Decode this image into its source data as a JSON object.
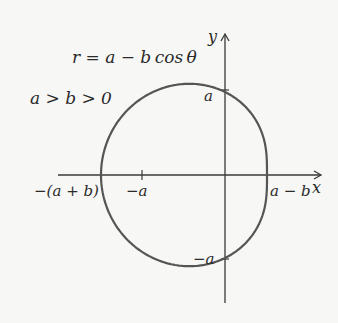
{
  "diagram": {
    "equation": "r = a − b cos θ",
    "condition": "a > b > 0",
    "axis_labels": {
      "x": "x",
      "y": "y"
    },
    "point_labels": {
      "top": "a",
      "bottom": "−a",
      "left_neg_a": "−a",
      "left_intercept": "−(a + b)",
      "right_intercept": "a − b"
    },
    "colors": {
      "curve": "#555555",
      "axis": "#3a3a3a",
      "background": "#f7f7f5"
    }
  },
  "chart_data": {
    "type": "line",
    "curve": "polar r = a - b cos(theta), theta in [0, 2pi]",
    "params_relative": {
      "a": 83,
      "b": 41
    },
    "labels": [
      "−(a + b)",
      "−a",
      "a − b",
      "a",
      "−a"
    ],
    "xlabel": "x",
    "ylabel": "y",
    "grid": false
  }
}
